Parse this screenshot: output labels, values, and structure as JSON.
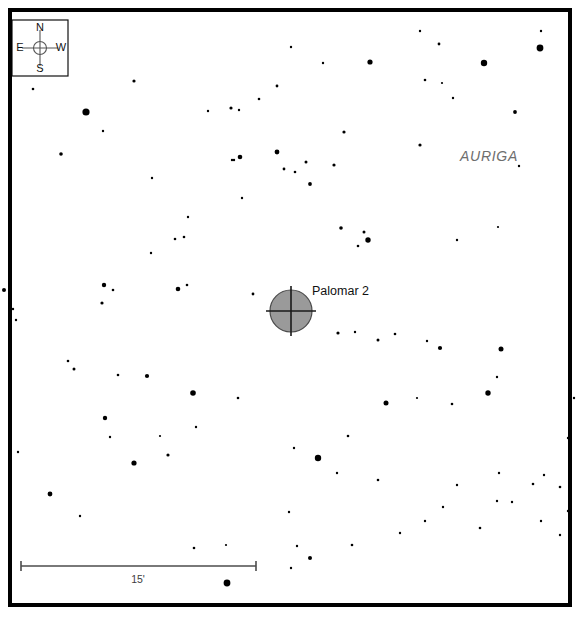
{
  "chart_data": {
    "type": "scatter",
    "xlabel": "",
    "ylabel": "",
    "xlim": [
      10,
      570
    ],
    "ylim": [
      10,
      605
    ],
    "grid": false,
    "legend_position": "none",
    "field": {
      "left": 10,
      "top": 10,
      "right": 570,
      "bottom": 605,
      "background_color": "#ffffff",
      "border_color": "#000000",
      "border_width": 4
    },
    "series": [
      {
        "name": "Field stars",
        "symbol": "filled-circle",
        "color": "#000000",
        "points": [
          {
            "x": 33,
            "y": 89,
            "r": 1.3
          },
          {
            "x": 134,
            "y": 81,
            "r": 1.6
          },
          {
            "x": 86,
            "y": 112,
            "r": 3.6
          },
          {
            "x": 103,
            "y": 131,
            "r": 1.2
          },
          {
            "x": 61,
            "y": 154,
            "r": 1.8
          },
          {
            "x": 231,
            "y": 108,
            "r": 1.6
          },
          {
            "x": 259,
            "y": 99,
            "r": 1.3
          },
          {
            "x": 291,
            "y": 47,
            "r": 1.2
          },
          {
            "x": 240,
            "y": 157,
            "r": 2.3
          },
          {
            "x": 234,
            "y": 160,
            "r": 1.2
          },
          {
            "x": 277,
            "y": 152,
            "r": 2.4
          },
          {
            "x": 284,
            "y": 169,
            "r": 1.4
          },
          {
            "x": 295,
            "y": 172,
            "r": 1.3
          },
          {
            "x": 306,
            "y": 162,
            "r": 1.5
          },
          {
            "x": 310,
            "y": 184,
            "r": 1.9
          },
          {
            "x": 323,
            "y": 63,
            "r": 1.2
          },
          {
            "x": 370,
            "y": 62,
            "r": 2.6
          },
          {
            "x": 420,
            "y": 31,
            "r": 1.2
          },
          {
            "x": 425,
            "y": 80,
            "r": 1.3
          },
          {
            "x": 442,
            "y": 83,
            "r": 1.1
          },
          {
            "x": 439,
            "y": 44,
            "r": 1.4
          },
          {
            "x": 420,
            "y": 145,
            "r": 1.6
          },
          {
            "x": 453,
            "y": 98,
            "r": 1.2
          },
          {
            "x": 484,
            "y": 63,
            "r": 3.2
          },
          {
            "x": 540,
            "y": 48,
            "r": 3.4
          },
          {
            "x": 541,
            "y": 31,
            "r": 1.2
          },
          {
            "x": 515,
            "y": 112,
            "r": 1.9
          },
          {
            "x": 277,
            "y": 86,
            "r": 1.4
          },
          {
            "x": 239,
            "y": 110,
            "r": 1.2
          },
          {
            "x": 152,
            "y": 178,
            "r": 1.2
          },
          {
            "x": 208,
            "y": 111,
            "r": 1.2
          },
          {
            "x": 232,
            "y": 160,
            "r": 1.2
          },
          {
            "x": 344,
            "y": 132,
            "r": 1.6
          },
          {
            "x": 334,
            "y": 165,
            "r": 1.6
          },
          {
            "x": 341,
            "y": 228,
            "r": 1.8
          },
          {
            "x": 368,
            "y": 240,
            "r": 2.7
          },
          {
            "x": 358,
            "y": 246,
            "r": 1.3
          },
          {
            "x": 364,
            "y": 232,
            "r": 1.5
          },
          {
            "x": 457,
            "y": 240,
            "r": 1.2
          },
          {
            "x": 498,
            "y": 227,
            "r": 1.1
          },
          {
            "x": 519,
            "y": 166,
            "r": 1.2
          },
          {
            "x": 4,
            "y": 290,
            "r": 2.0
          },
          {
            "x": 16,
            "y": 320,
            "r": 1.2
          },
          {
            "x": 104,
            "y": 285,
            "r": 2.2
          },
          {
            "x": 113,
            "y": 290,
            "r": 1.3
          },
          {
            "x": 178,
            "y": 289,
            "r": 2.3
          },
          {
            "x": 187,
            "y": 285,
            "r": 1.3
          },
          {
            "x": 253,
            "y": 294,
            "r": 1.4
          },
          {
            "x": 151,
            "y": 253,
            "r": 1.2
          },
          {
            "x": 175,
            "y": 239,
            "r": 1.3
          },
          {
            "x": 184,
            "y": 237,
            "r": 1.3
          },
          {
            "x": 188,
            "y": 217,
            "r": 1.2
          },
          {
            "x": 242,
            "y": 198,
            "r": 1.2
          },
          {
            "x": 338,
            "y": 333,
            "r": 1.6
          },
          {
            "x": 378,
            "y": 340,
            "r": 1.5
          },
          {
            "x": 395,
            "y": 334,
            "r": 1.3
          },
          {
            "x": 501,
            "y": 349,
            "r": 2.5
          },
          {
            "x": 497,
            "y": 377,
            "r": 1.2
          },
          {
            "x": 102,
            "y": 303,
            "r": 1.6
          },
          {
            "x": 13,
            "y": 309,
            "r": 1.2
          },
          {
            "x": 68,
            "y": 361,
            "r": 1.3
          },
          {
            "x": 74,
            "y": 369,
            "r": 1.5
          },
          {
            "x": 118,
            "y": 375,
            "r": 1.3
          },
          {
            "x": 147,
            "y": 376,
            "r": 2.1
          },
          {
            "x": 193,
            "y": 393,
            "r": 2.8
          },
          {
            "x": 238,
            "y": 398,
            "r": 1.3
          },
          {
            "x": 105,
            "y": 418,
            "r": 2.2
          },
          {
            "x": 110,
            "y": 437,
            "r": 1.2
          },
          {
            "x": 160,
            "y": 436,
            "r": 1.1
          },
          {
            "x": 196,
            "y": 427,
            "r": 1.2
          },
          {
            "x": 168,
            "y": 455,
            "r": 1.6
          },
          {
            "x": 134,
            "y": 463,
            "r": 2.6
          },
          {
            "x": 18,
            "y": 452,
            "r": 1.2
          },
          {
            "x": 50,
            "y": 494,
            "r": 2.4
          },
          {
            "x": 80,
            "y": 516,
            "r": 1.2
          },
          {
            "x": 194,
            "y": 548,
            "r": 1.3
          },
          {
            "x": 226,
            "y": 545,
            "r": 1.1
          },
          {
            "x": 227,
            "y": 583,
            "r": 3.4
          },
          {
            "x": 289,
            "y": 512,
            "r": 1.2
          },
          {
            "x": 294,
            "y": 448,
            "r": 1.2
          },
          {
            "x": 318,
            "y": 458,
            "r": 3.2
          },
          {
            "x": 337,
            "y": 473,
            "r": 1.2
          },
          {
            "x": 348,
            "y": 436,
            "r": 1.3
          },
          {
            "x": 378,
            "y": 480,
            "r": 1.3
          },
          {
            "x": 386,
            "y": 403,
            "r": 2.5
          },
          {
            "x": 440,
            "y": 348,
            "r": 2.1
          },
          {
            "x": 417,
            "y": 398,
            "r": 1.1
          },
          {
            "x": 452,
            "y": 404,
            "r": 1.3
          },
          {
            "x": 488,
            "y": 393,
            "r": 2.7
          },
          {
            "x": 499,
            "y": 473,
            "r": 1.2
          },
          {
            "x": 512,
            "y": 502,
            "r": 1.2
          },
          {
            "x": 497,
            "y": 501,
            "r": 1.2
          },
          {
            "x": 533,
            "y": 484,
            "r": 1.3
          },
          {
            "x": 541,
            "y": 521,
            "r": 1.2
          },
          {
            "x": 544,
            "y": 475,
            "r": 1.2
          },
          {
            "x": 560,
            "y": 487,
            "r": 1.3
          },
          {
            "x": 568,
            "y": 511,
            "r": 1.2
          },
          {
            "x": 560,
            "y": 535,
            "r": 1.2
          },
          {
            "x": 480,
            "y": 528,
            "r": 1.3
          },
          {
            "x": 457,
            "y": 485,
            "r": 1.2
          },
          {
            "x": 443,
            "y": 507,
            "r": 1.2
          },
          {
            "x": 425,
            "y": 521,
            "r": 1.2
          },
          {
            "x": 400,
            "y": 533,
            "r": 1.2
          },
          {
            "x": 352,
            "y": 545,
            "r": 1.3
          },
          {
            "x": 297,
            "y": 546,
            "r": 1.2
          },
          {
            "x": 291,
            "y": 568,
            "r": 1.2
          },
          {
            "x": 310,
            "y": 558,
            "r": 2.0
          },
          {
            "x": 568,
            "y": 438,
            "r": 1.2
          },
          {
            "x": 574,
            "y": 398,
            "r": 1.2
          },
          {
            "x": 355,
            "y": 332,
            "r": 1.2
          },
          {
            "x": 427,
            "y": 341,
            "r": 1.2
          }
        ]
      }
    ],
    "deep_sky_objects": [
      {
        "name": "Palomar 2",
        "label": "Palomar 2",
        "type": "globular-cluster",
        "x": 291,
        "y": 311,
        "radius": 21,
        "fill_color": "#9a9a9a",
        "outline_color": "#4a4a4a",
        "label_x": 312,
        "label_y": 292
      }
    ],
    "annotations": [
      {
        "name": "constellation",
        "text": "AURIGA",
        "x": 489,
        "y": 157,
        "style": "italic",
        "color": "#6e6e6e"
      }
    ],
    "scale_bar": {
      "label": "15'",
      "unit": "arcminutes",
      "value": 15,
      "x1": 21,
      "x2": 256,
      "y": 566,
      "cap_half_height": 5,
      "label_x": 138,
      "label_y": 580,
      "color": "#4c4c4c"
    },
    "compass": {
      "box": {
        "x": 12,
        "y": 20,
        "width": 56,
        "height": 56
      },
      "center": {
        "x": 40,
        "y": 48
      },
      "hub_radius": 6.5,
      "arm_length": 18,
      "directions": [
        {
          "label": "N",
          "x": 40,
          "y": 28,
          "position": "top"
        },
        {
          "label": "S",
          "x": 40,
          "y": 69,
          "position": "bottom"
        },
        {
          "label": "E",
          "x": 20,
          "y": 48,
          "position": "left"
        },
        {
          "label": "W",
          "x": 61,
          "y": 48,
          "position": "right"
        }
      ]
    }
  }
}
